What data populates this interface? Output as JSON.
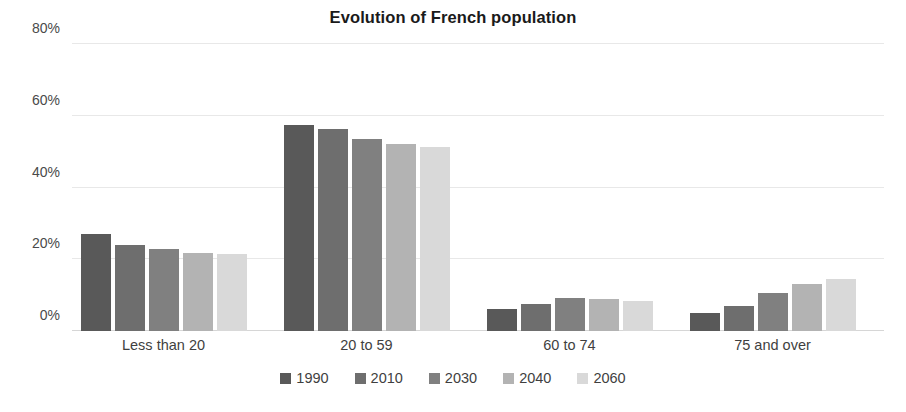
{
  "chart_data": {
    "type": "bar",
    "title": "Evolution of French population",
    "xlabel": "",
    "ylabel": "",
    "ylim": [
      0,
      80
    ],
    "ytick_values": [
      0,
      20,
      40,
      60,
      80
    ],
    "ytick_labels": [
      "0%",
      "20%",
      "40%",
      "60%",
      "80%"
    ],
    "grid": true,
    "legend_position": "bottom",
    "unit": "%",
    "categories": [
      "Less than 20",
      "20 to 59",
      "60 to 74",
      "75 and over"
    ],
    "series": [
      {
        "name": "1990",
        "color": "#595959",
        "values": [
          27.0,
          57.3,
          6.0,
          5.0
        ]
      },
      {
        "name": "2010",
        "color": "#6E6E6E",
        "values": [
          24.0,
          56.3,
          7.5,
          7.0
        ]
      },
      {
        "name": "2030",
        "color": "#808080",
        "values": [
          22.8,
          53.5,
          9.3,
          10.5
        ]
      },
      {
        "name": "2040",
        "color": "#B3B3B3",
        "values": [
          21.8,
          52.0,
          8.8,
          13.0
        ]
      },
      {
        "name": "2060",
        "color": "#D9D9D9",
        "values": [
          21.5,
          51.3,
          8.3,
          14.5
        ]
      }
    ]
  },
  "colors": {
    "background": "#ffffff",
    "title_text": "#1a1a1a",
    "axis_text": "#4a4a4a",
    "label_text": "#3f3f3f",
    "gridline": "#e8e8e8",
    "baseline": "#d6d6d6"
  }
}
